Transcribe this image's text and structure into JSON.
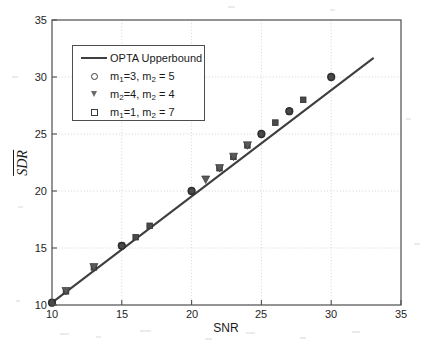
{
  "figure": {
    "background_color": "#ffffff",
    "axis_color": "#4d4d4d",
    "grid_color": "#c8c8c8",
    "line_color": "#3f3f3f",
    "marker_color": "#4a4a4a"
  },
  "axes": {
    "xlabel": "SNR",
    "ylabel": "SDR",
    "ylabel_has_overline": true,
    "xticks": [
      "10",
      "15",
      "20",
      "25",
      "30",
      "35"
    ],
    "yticks": [
      "10",
      "15",
      "20",
      "25",
      "30",
      "35"
    ],
    "xlim": [
      10,
      35
    ],
    "ylim": [
      10,
      35
    ]
  },
  "legend": {
    "entries": [
      {
        "symbol": "line",
        "label_plain": "OPTA Upperbound",
        "label_html": "OPTA Upperbound"
      },
      {
        "symbol": "circle",
        "label_plain": "m1=3, m2 = 5",
        "label_html": "m<sub>1</sub>=3, m<sub>2</sub> = 5"
      },
      {
        "symbol": "triangle-down",
        "label_plain": "m2=4, m2 = 4",
        "label_html": "m<sub>2</sub>=4, m<sub>2</sub> = 4"
      },
      {
        "symbol": "square",
        "label_plain": "m1=1, m2 = 7",
        "label_html": "m<sub>1</sub>=1, m<sub>2</sub> = 7"
      }
    ]
  },
  "chart_data": {
    "type": "line",
    "title": "",
    "xlabel": "SNR",
    "ylabel": "SDR",
    "xlim": [
      10,
      35
    ],
    "ylim": [
      10,
      35
    ],
    "grid": true,
    "legend_position": "upper-left",
    "series": [
      {
        "name": "OPTA Upperbound",
        "style": "line",
        "x": [
          10,
          31.2
        ],
        "y": [
          10.2,
          31.3
        ]
      },
      {
        "name": "m1=3, m2 = 5",
        "style": "marker-circle",
        "x": [
          10,
          15,
          20,
          25,
          27,
          30
        ],
        "y": [
          10.2,
          15.2,
          20.0,
          25.0,
          27.0,
          30.0
        ]
      },
      {
        "name": "m2=4, m2 = 4",
        "style": "marker-triangle-down",
        "x": [
          11,
          13,
          21,
          22,
          23,
          24
        ],
        "y": [
          11.2,
          13.3,
          21.0,
          22.0,
          23.0,
          24.0
        ]
      },
      {
        "name": "m1=1, m2 = 7",
        "style": "marker-square",
        "x": [
          10,
          11,
          13,
          15,
          16,
          17,
          20,
          22,
          23,
          24,
          25,
          26,
          27,
          28,
          30
        ],
        "y": [
          10.2,
          11.2,
          13.3,
          15.2,
          16.0,
          17.0,
          20.0,
          22.0,
          23.0,
          24.0,
          25.0,
          26.0,
          27.0,
          28.0,
          30.0
        ]
      }
    ]
  }
}
